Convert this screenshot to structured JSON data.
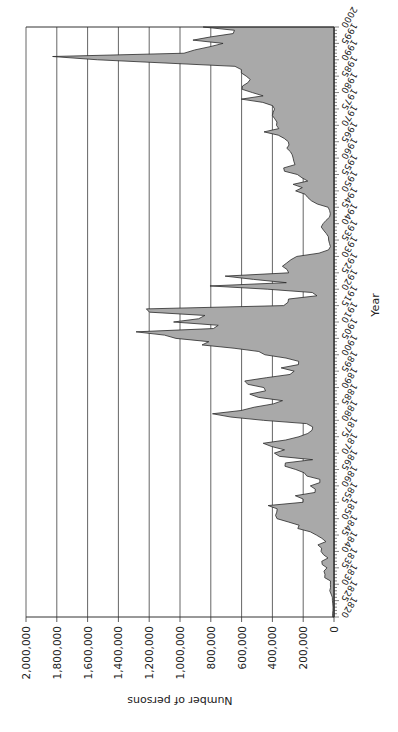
{
  "chart_data": {
    "type": "area",
    "orientation_note": "figure rotated 90 degrees clockwise",
    "title": "",
    "xlabel": "Year",
    "ylabel": "Number of persons",
    "xlim": [
      1820,
      2000
    ],
    "ylim": [
      0,
      2000000
    ],
    "grid": true,
    "legend": null,
    "y_ticks": [
      {
        "value": 0,
        "label": "0"
      },
      {
        "value": 200000,
        "label": "200,000"
      },
      {
        "value": 400000,
        "label": "400,000"
      },
      {
        "value": 600000,
        "label": "600,000"
      },
      {
        "value": 800000,
        "label": "800,000"
      },
      {
        "value": 1000000,
        "label": "1,000,000"
      },
      {
        "value": 1200000,
        "label": "1,200,000"
      },
      {
        "value": 1400000,
        "label": "1,400,000"
      },
      {
        "value": 1600000,
        "label": "1,600,000"
      },
      {
        "value": 1800000,
        "label": "1,800,000"
      },
      {
        "value": 2000000,
        "label": "2,000,000"
      }
    ],
    "x_ticks": [
      "1820",
      "1825",
      "1830",
      "1835",
      "1840",
      "1845",
      "1850",
      "1855",
      "1860",
      "1865",
      "1870",
      "1875",
      "1880",
      "1885",
      "1890",
      "1895",
      "1900",
      "1905",
      "1910",
      "1915",
      "1920",
      "1925",
      "1930",
      "1935",
      "1940",
      "1945",
      "1950",
      "1955",
      "1960",
      "1965",
      "1970",
      "1975",
      "1980",
      "1985",
      "1990",
      "1995",
      "2000"
    ],
    "x": [
      1820,
      1821,
      1822,
      1823,
      1824,
      1825,
      1826,
      1827,
      1828,
      1829,
      1830,
      1831,
      1832,
      1833,
      1834,
      1835,
      1836,
      1837,
      1838,
      1839,
      1840,
      1841,
      1842,
      1843,
      1844,
      1845,
      1846,
      1847,
      1848,
      1849,
      1850,
      1851,
      1852,
      1853,
      1854,
      1855,
      1856,
      1857,
      1858,
      1859,
      1860,
      1861,
      1862,
      1863,
      1864,
      1865,
      1866,
      1867,
      1868,
      1869,
      1870,
      1871,
      1872,
      1873,
      1874,
      1875,
      1876,
      1877,
      1878,
      1879,
      1880,
      1881,
      1882,
      1883,
      1884,
      1885,
      1886,
      1887,
      1888,
      1889,
      1890,
      1891,
      1892,
      1893,
      1894,
      1895,
      1896,
      1897,
      1898,
      1899,
      1900,
      1901,
      1902,
      1903,
      1904,
      1905,
      1906,
      1907,
      1908,
      1909,
      1910,
      1911,
      1912,
      1913,
      1914,
      1915,
      1916,
      1917,
      1918,
      1919,
      1920,
      1921,
      1922,
      1923,
      1924,
      1925,
      1926,
      1927,
      1928,
      1929,
      1930,
      1931,
      1932,
      1933,
      1934,
      1935,
      1936,
      1937,
      1938,
      1939,
      1940,
      1941,
      1942,
      1943,
      1944,
      1945,
      1946,
      1947,
      1948,
      1949,
      1950,
      1951,
      1952,
      1953,
      1954,
      1955,
      1956,
      1957,
      1958,
      1959,
      1960,
      1961,
      1962,
      1963,
      1964,
      1965,
      1966,
      1967,
      1968,
      1969,
      1970,
      1971,
      1972,
      1973,
      1974,
      1975,
      1976,
      1977,
      1978,
      1979,
      1980,
      1981,
      1982,
      1983,
      1984,
      1985,
      1986,
      1987,
      1988,
      1989,
      1990,
      1991,
      1992,
      1993,
      1994,
      1995,
      1996,
      1997,
      1998,
      1999,
      2000
    ],
    "series": [
      {
        "name": "Number of persons",
        "values": [
          8385,
          9127,
          6911,
          6354,
          7912,
          10199,
          10837,
          18875,
          27382,
          22520,
          23322,
          22633,
          60482,
          58640,
          65365,
          45374,
          76242,
          79340,
          38914,
          68069,
          84066,
          80289,
          104565,
          52496,
          78615,
          114371,
          154416,
          234968,
          226527,
          297024,
          369980,
          379466,
          371603,
          368645,
          427833,
          200877,
          200436,
          251306,
          123126,
          121282,
          153640,
          91918,
          91985,
          176282,
          193418,
          248120,
          318568,
          315722,
          138840,
          352768,
          387203,
          321350,
          404806,
          459803,
          313339,
          227498,
          169986,
          141857,
          138469,
          177826,
          457257,
          669431,
          788992,
          603322,
          518592,
          395346,
          334203,
          490109,
          546889,
          444427,
          455302,
          560319,
          579663,
          439730,
          285631,
          258536,
          343267,
          230832,
          229299,
          311715,
          448572,
          487918,
          648743,
          857046,
          812870,
          1026499,
          1100735,
          1285349,
          782870,
          751786,
          1041570,
          878587,
          838172,
          1197892,
          1218480,
          326700,
          298826,
          295403,
          110618,
          141132,
          430001,
          805228,
          309556,
          522919,
          706896,
          294314,
          304488,
          335175,
          307255,
          279678,
          241700,
          97139,
          35576,
          23068,
          29470,
          34956,
          36329,
          50244,
          67895,
          82998,
          70756,
          51776,
          28781,
          23725,
          28551,
          38119,
          108721,
          147292,
          170570,
          188317,
          249187,
          205717,
          265520,
          170434,
          208177,
          237790,
          321625,
          326867,
          253265,
          260686,
          265398,
          271344,
          283763,
          306260,
          292248,
          296697,
          323040,
          361972,
          454448,
          358579,
          373326,
          370478,
          384685,
          400063,
          394861,
          386194,
          398613,
          462315,
          601442,
          460348,
          530639,
          596600,
          594131,
          559763,
          543903,
          570009,
          601708,
          601516,
          643025,
          1090924,
          1536483,
          1827167,
          973977,
          904292,
          804416,
          720461,
          915900,
          798378,
          654451,
          646568,
          849807
        ]
      }
    ]
  },
  "colors": {
    "fill": "#a9a9a9",
    "line": "#2a2a2a",
    "grid": "#555555",
    "background": "#ffffff"
  }
}
